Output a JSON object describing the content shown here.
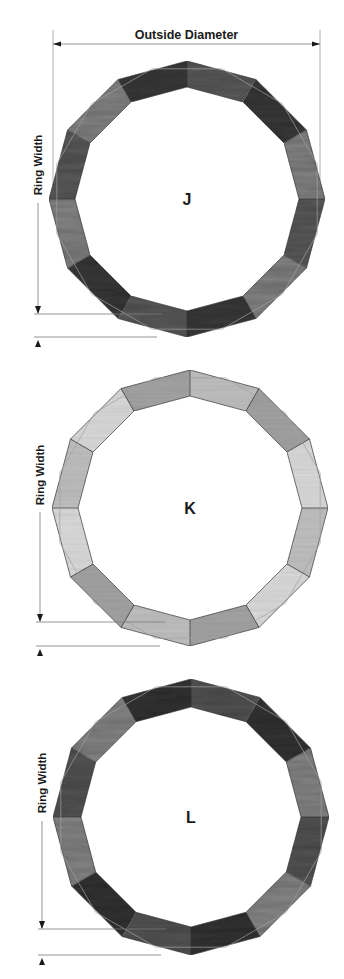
{
  "diagram": {
    "outside_diameter_label": "Outside Diameter",
    "ring_width_label": "Ring Width",
    "segments_per_ring": 12,
    "rings": [
      {
        "id": "J",
        "label": "J",
        "cx": 187,
        "cy": 199,
        "outer_r": 138,
        "inner_r": 112,
        "wood": "dark",
        "colors": {
          "base": "#5e5e5e",
          "light": "#8a8a8a",
          "dark": "#3c3c3c",
          "edge": "#2e2e2e"
        },
        "ring_width_dim": {
          "x": 38,
          "label_y": 165,
          "line_top": 203,
          "arrow_top_y": 314,
          "arrow_bottom_y": 337
        }
      },
      {
        "id": "K",
        "label": "K",
        "cx": 190,
        "cy": 508,
        "outer_r": 138,
        "inner_r": 112,
        "wood": "light",
        "colors": {
          "base": "#c4c4c4",
          "light": "#dedede",
          "dark": "#a6a6a6",
          "edge": "#5a5a5a"
        },
        "ring_width_dim": {
          "x": 40,
          "label_y": 475,
          "line_top": 512,
          "arrow_top_y": 622,
          "arrow_bottom_y": 646
        }
      },
      {
        "id": "L",
        "label": "L",
        "cx": 191,
        "cy": 817,
        "outer_r": 138,
        "inner_r": 110,
        "wood": "dark",
        "colors": {
          "base": "#585858",
          "light": "#8c8c8c",
          "dark": "#363636",
          "edge": "#2a2a2a"
        },
        "ring_width_dim": {
          "x": 42,
          "label_y": 783,
          "line_top": 821,
          "arrow_top_y": 929,
          "arrow_bottom_y": 955
        }
      }
    ],
    "outside_diameter_dim": {
      "y": 44,
      "x1": 53,
      "x2": 320,
      "label_y": 39,
      "ext_top": 30,
      "ext_bottom": 200
    }
  }
}
